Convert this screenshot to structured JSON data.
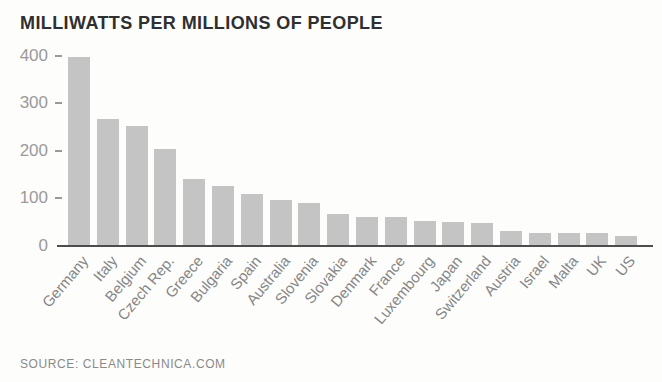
{
  "title": "MILLIWATTS PER MILLIONS OF PEOPLE",
  "source": "SOURCE: CLEANTECHNICA.COM",
  "colors": {
    "bar": "#c4c4c4",
    "axis_line": "#4d4d4d",
    "title_text": "#2f2f2f",
    "y_tick_text": "#9a9a9a",
    "x_label_text": "#868686",
    "source_text": "#8a8a8a",
    "background": "#fdfdfc"
  },
  "chart_data": {
    "type": "bar",
    "title": "MILLIWATTS PER MILLIONS OF PEOPLE",
    "xlabel": "",
    "ylabel": "",
    "ylim": [
      0,
      400
    ],
    "yticks": [
      0,
      100,
      200,
      300,
      400
    ],
    "grid": false,
    "legend": false,
    "bar_color": "#c4c4c4",
    "categories": [
      "Germany",
      "Italy",
      "Belgium",
      "Czech Rep.",
      "Greece",
      "Bulgaria",
      "Spain",
      "Australia",
      "Slovenia",
      "Slovakia",
      "Denmark",
      "France",
      "Luxembourg",
      "Japan",
      "Switzerland",
      "Austria",
      "Israel",
      "Malta",
      "UK",
      "US"
    ],
    "values": [
      397,
      266,
      252,
      203,
      141,
      127,
      110,
      97,
      90,
      68,
      61,
      60,
      53,
      50,
      48,
      31,
      28,
      28,
      27,
      22
    ],
    "source": "SOURCE: CLEANTECHNICA.COM"
  }
}
